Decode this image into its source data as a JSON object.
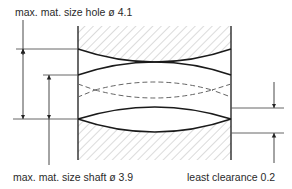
{
  "diagram": {
    "title": "",
    "labels": {
      "hole": "max. mat. size hole ø 4.1",
      "shaft": "max. mat. size shaft ø 3.9",
      "clearance": "least clearance 0.2"
    },
    "values": {
      "hole_diameter": 4.1,
      "shaft_diameter": 3.9,
      "least_clearance": 0.2
    },
    "colors": {
      "outline": "#1a1a1a",
      "dimension_line": "#555555",
      "hatch": "#b8b8b8",
      "dashed": "#666666"
    }
  }
}
